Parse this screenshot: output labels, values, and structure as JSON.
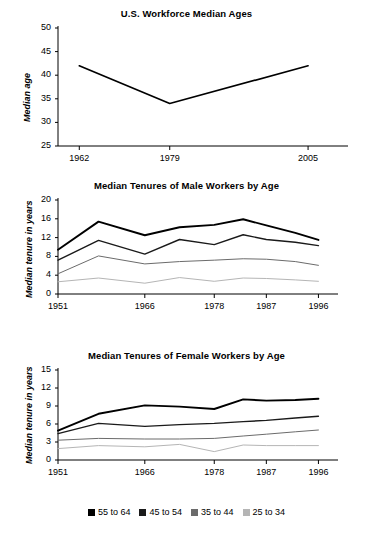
{
  "figure": {
    "background": "#ffffff",
    "ink": "#000000"
  },
  "series_colors": {
    "55 to 64": "#000000",
    "45 to 54": "#1a1a1a",
    "35 to 44": "#6b6b6b",
    "25 to 34": "#b5b5b5"
  },
  "legend": {
    "position": "bottom-center",
    "items": [
      {
        "label": "55 to 64",
        "color": "#000000"
      },
      {
        "label": "45 to 54",
        "color": "#1a1a1a"
      },
      {
        "label": "35 to 44",
        "color": "#6b6b6b"
      },
      {
        "label": "25 to 34",
        "color": "#b5b5b5"
      }
    ]
  },
  "chart_data": [
    {
      "id": "workforce-median-ages",
      "type": "line",
      "title": "U.S. Workforce Median Ages",
      "xlabel": "",
      "ylabel": "Median age",
      "ylim": [
        25,
        50
      ],
      "yticks": [
        25,
        30,
        35,
        40,
        45,
        50
      ],
      "ytick_labels": [
        "25",
        "30",
        "35",
        "40",
        "45",
        "50"
      ],
      "xlim": [
        1958,
        2011
      ],
      "xticks": [
        1962,
        1979,
        2005
      ],
      "xtick_labels": [
        "1962",
        "1979",
        "2005"
      ],
      "grid": false,
      "series": [
        {
          "name": "Median age",
          "color": "#000000",
          "x": [
            1962,
            1979,
            2005
          ],
          "values": [
            42,
            34,
            42
          ]
        }
      ]
    },
    {
      "id": "male-worker-tenures",
      "type": "line",
      "title": "Median Tenures of Male Workers by Age",
      "xlabel": "",
      "ylabel": "Median tenure in years",
      "ylim": [
        0,
        20
      ],
      "yticks": [
        0,
        4,
        8,
        12,
        16,
        20
      ],
      "ytick_labels": [
        "0",
        "4",
        "8",
        "12",
        "16",
        "20"
      ],
      "xlim": [
        1951,
        1998
      ],
      "xticks": [
        1951,
        1966,
        1978,
        1987,
        1996
      ],
      "xtick_labels": [
        "1951",
        "1966",
        "1978",
        "1987",
        "1996"
      ],
      "grid": false,
      "x": [
        1951,
        1958,
        1966,
        1972,
        1978,
        1983,
        1987,
        1992,
        1996
      ],
      "series": [
        {
          "name": "55 to 64",
          "color": "#000000",
          "values": [
            9.4,
            15.4,
            12.5,
            14.2,
            14.7,
            15.9,
            14.6,
            13.0,
            11.5
          ]
        },
        {
          "name": "45 to 54",
          "color": "#1a1a1a",
          "values": [
            7.2,
            11.4,
            8.5,
            11.6,
            10.5,
            12.6,
            11.6,
            11.0,
            10.3
          ]
        },
        {
          "name": "35 to 44",
          "color": "#6b6b6b",
          "values": [
            4.3,
            8.1,
            6.4,
            6.9,
            7.2,
            7.5,
            7.4,
            6.9,
            6.1
          ]
        },
        {
          "name": "25 to 34",
          "color": "#b5b5b5",
          "values": [
            2.6,
            3.4,
            2.3,
            3.5,
            2.7,
            3.4,
            3.3,
            3.0,
            2.7
          ]
        }
      ]
    },
    {
      "id": "female-worker-tenures",
      "type": "line",
      "title": "Median Tenures of Female Workers by Age",
      "xlabel": "",
      "ylabel": "Median tenure in years",
      "ylim": [
        0,
        15
      ],
      "yticks": [
        0,
        3,
        6,
        9,
        12,
        15
      ],
      "ytick_labels": [
        "0",
        "3",
        "6",
        "9",
        "12",
        "15"
      ],
      "xlim": [
        1951,
        1998
      ],
      "xticks": [
        1951,
        1966,
        1978,
        1987,
        1996
      ],
      "xtick_labels": [
        "1951",
        "1966",
        "1978",
        "1987",
        "1996"
      ],
      "grid": false,
      "x": [
        1951,
        1958,
        1966,
        1972,
        1978,
        1983,
        1987,
        1992,
        1996
      ],
      "series": [
        {
          "name": "55 to 64",
          "color": "#000000",
          "values": [
            4.9,
            7.7,
            9.1,
            8.9,
            8.5,
            10.1,
            9.9,
            10.0,
            10.2
          ]
        },
        {
          "name": "45 to 54",
          "color": "#1a1a1a",
          "values": [
            4.4,
            6.1,
            5.6,
            5.9,
            6.1,
            6.4,
            6.6,
            7.0,
            7.3
          ]
        },
        {
          "name": "35 to 44",
          "color": "#6b6b6b",
          "values": [
            3.3,
            3.6,
            3.5,
            3.5,
            3.6,
            4.0,
            4.3,
            4.7,
            5.0
          ]
        },
        {
          "name": "25 to 34",
          "color": "#b5b5b5",
          "values": [
            1.9,
            2.4,
            2.2,
            2.6,
            1.4,
            2.5,
            2.4,
            2.4,
            2.4
          ]
        }
      ]
    }
  ]
}
